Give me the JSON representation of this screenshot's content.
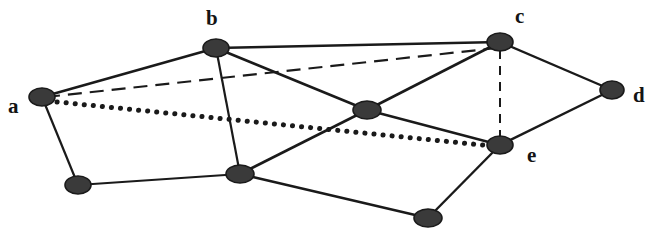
{
  "figure": {
    "kind": "undirected-graph-diagram",
    "background_color": "#ffffff",
    "width": 665,
    "height": 236,
    "node_fill_color": "#3a3a3a",
    "node_stroke_color": "#1a1a1a",
    "edge_color": "#1a1a1a"
  },
  "nodes": [
    {
      "id": "a",
      "label": "a",
      "labelled": true,
      "cx": 42,
      "cy": 97,
      "rx": 13,
      "ry": 9,
      "label_x": 8,
      "label_y": 96
    },
    {
      "id": "b",
      "label": "b",
      "labelled": true,
      "cx": 216,
      "cy": 48,
      "rx": 13,
      "ry": 9,
      "label_x": 206,
      "label_y": 8
    },
    {
      "id": "c",
      "label": "c",
      "labelled": true,
      "cx": 500,
      "cy": 42,
      "rx": 13,
      "ry": 9,
      "label_x": 515,
      "label_y": 6
    },
    {
      "id": "d",
      "label": "d",
      "labelled": true,
      "cx": 612,
      "cy": 90,
      "rx": 12,
      "ry": 9,
      "label_x": 633,
      "label_y": 85
    },
    {
      "id": "e",
      "label": "e",
      "labelled": true,
      "cx": 500,
      "cy": 145,
      "rx": 13,
      "ry": 9,
      "label_x": 527,
      "label_y": 145
    },
    {
      "id": "n1",
      "label": "",
      "labelled": false,
      "cx": 367,
      "cy": 110,
      "rx": 14,
      "ry": 9,
      "label_x": 0,
      "label_y": 0
    },
    {
      "id": "n2",
      "label": "",
      "labelled": false,
      "cx": 78,
      "cy": 185,
      "rx": 13,
      "ry": 9,
      "label_x": 0,
      "label_y": 0
    },
    {
      "id": "n3",
      "label": "",
      "labelled": false,
      "cx": 240,
      "cy": 174,
      "rx": 14,
      "ry": 9,
      "label_x": 0,
      "label_y": 0
    },
    {
      "id": "n4",
      "label": "",
      "labelled": false,
      "cx": 428,
      "cy": 218,
      "rx": 14,
      "ry": 9,
      "label_x": 0,
      "label_y": 0
    }
  ],
  "edges": [
    {
      "id": "a-b",
      "from": "a",
      "to": "b",
      "style": "solid",
      "x1": 42,
      "y1": 97,
      "x2": 216,
      "y2": 48,
      "width": 2.6
    },
    {
      "id": "a-n2",
      "from": "a",
      "to": "n2",
      "style": "solid",
      "x1": 42,
      "y1": 97,
      "x2": 78,
      "y2": 185,
      "width": 2.2
    },
    {
      "id": "b-c",
      "from": "b",
      "to": "c",
      "style": "solid",
      "x1": 216,
      "y1": 48,
      "x2": 500,
      "y2": 42,
      "width": 2.6
    },
    {
      "id": "b-n1",
      "from": "b",
      "to": "n1",
      "style": "solid",
      "x1": 216,
      "y1": 48,
      "x2": 367,
      "y2": 110,
      "width": 2.6
    },
    {
      "id": "b-n3",
      "from": "b",
      "to": "n3",
      "style": "solid",
      "x1": 216,
      "y1": 48,
      "x2": 240,
      "y2": 174,
      "width": 2.2
    },
    {
      "id": "c-d",
      "from": "c",
      "to": "d",
      "style": "solid",
      "x1": 500,
      "y1": 42,
      "x2": 612,
      "y2": 90,
      "width": 2.4
    },
    {
      "id": "c-n1",
      "from": "c",
      "to": "n1",
      "style": "solid",
      "x1": 500,
      "y1": 42,
      "x2": 367,
      "y2": 110,
      "width": 2.6
    },
    {
      "id": "d-e",
      "from": "d",
      "to": "e",
      "style": "solid",
      "x1": 612,
      "y1": 90,
      "x2": 500,
      "y2": 145,
      "width": 2.4
    },
    {
      "id": "e-n1",
      "from": "e",
      "to": "n1",
      "style": "solid",
      "x1": 500,
      "y1": 145,
      "x2": 367,
      "y2": 110,
      "width": 2.4
    },
    {
      "id": "e-n4",
      "from": "e",
      "to": "n4",
      "style": "solid",
      "x1": 500,
      "y1": 145,
      "x2": 428,
      "y2": 218,
      "width": 2.4
    },
    {
      "id": "n1-n3",
      "from": "n1",
      "to": "n3",
      "style": "solid",
      "x1": 367,
      "y1": 110,
      "x2": 240,
      "y2": 174,
      "width": 2.6
    },
    {
      "id": "n2-n3",
      "from": "n2",
      "to": "n3",
      "style": "solid",
      "x1": 78,
      "y1": 185,
      "x2": 240,
      "y2": 174,
      "width": 2.2
    },
    {
      "id": "n3-n4",
      "from": "n3",
      "to": "n4",
      "style": "solid",
      "x1": 240,
      "y1": 174,
      "x2": 428,
      "y2": 218,
      "width": 2.4
    },
    {
      "id": "a-c",
      "from": "a",
      "to": "c",
      "style": "dashed",
      "x1": 46,
      "y1": 97,
      "x2": 497,
      "y2": 48,
      "width": 2.2,
      "dash": "14,8"
    },
    {
      "id": "c-e",
      "from": "c",
      "to": "e",
      "style": "dashed",
      "x1": 500,
      "y1": 50,
      "x2": 500,
      "y2": 139,
      "width": 2.0,
      "dash": "9,7"
    },
    {
      "id": "a-e",
      "from": "a",
      "to": "e",
      "style": "dotted",
      "x1": 48,
      "y1": 101,
      "x2": 492,
      "y2": 146,
      "width": 5.0,
      "dash": "0.1,9"
    }
  ],
  "labels": {
    "a": "a",
    "b": "b",
    "c": "c",
    "d": "d",
    "e": "e"
  }
}
